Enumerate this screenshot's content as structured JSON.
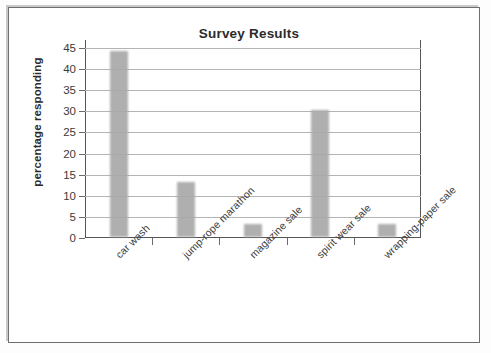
{
  "chart_data": {
    "type": "bar",
    "title": "Survey Results",
    "xlabel": "",
    "ylabel": "percentage responding",
    "categories": [
      "car wash",
      "jump-rope marathon",
      "magazine sale",
      "spirit wear sale",
      "wrapping-paper sale"
    ],
    "values": [
      44,
      13,
      3,
      30,
      3
    ],
    "ylim": [
      0,
      45
    ],
    "ytick_step": 5,
    "ytick_labels": [
      "0",
      "5",
      "10",
      "15",
      "20",
      "25",
      "30",
      "35",
      "40",
      "45"
    ],
    "ytick_values": [
      0,
      5,
      10,
      15,
      20,
      25,
      30,
      35,
      40,
      45
    ],
    "grid": true,
    "grid_axis": "y",
    "legend": false,
    "legend_position": "none",
    "bar_color": "#a9a9a9",
    "axis_color": "#555555",
    "gridline_color": "#b4b4b4",
    "text_color": "#2b2b2b",
    "xlabel_rotation": -45
  }
}
